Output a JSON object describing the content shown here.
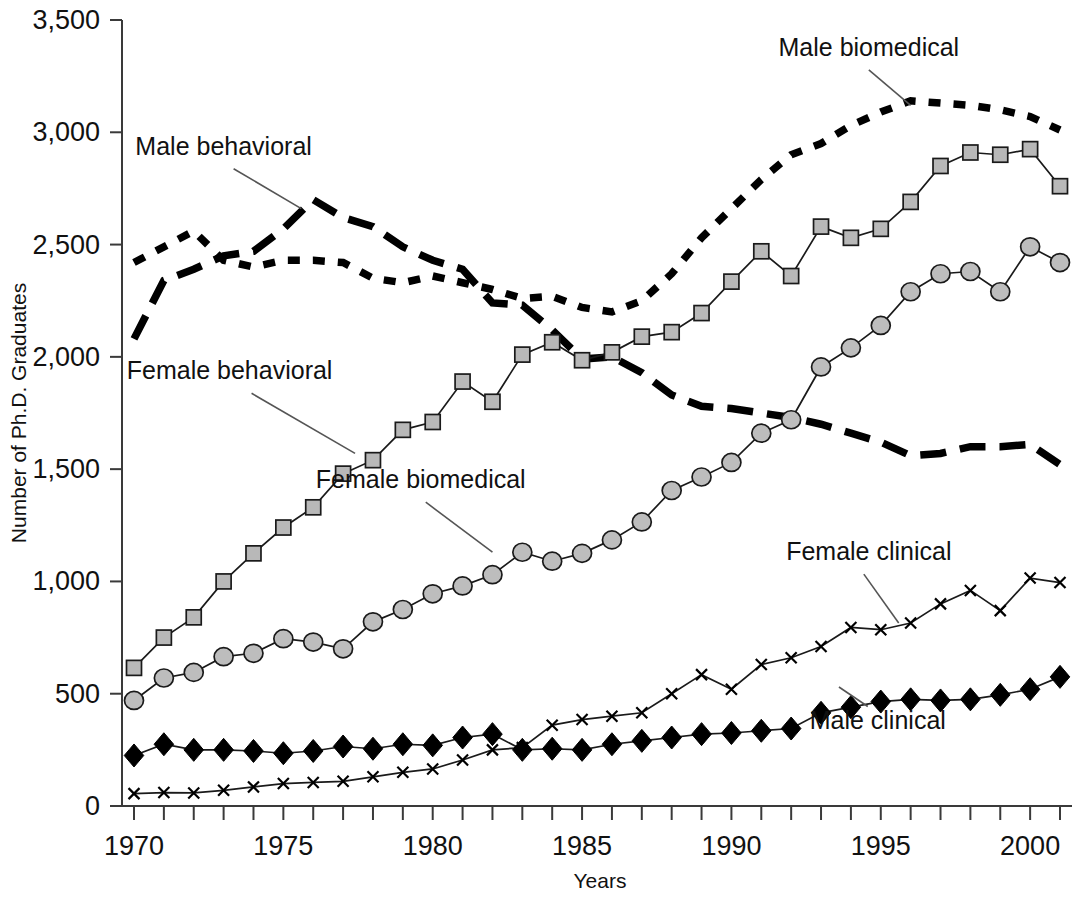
{
  "chart_data": {
    "type": "line",
    "title": "",
    "xlabel": "Years",
    "ylabel": "Number of Ph.D. Graduates",
    "xlim": [
      1969.4,
      2001.6
    ],
    "ylim": [
      0,
      3500
    ],
    "grid": false,
    "legend_position": "inline-annotations",
    "x": [
      1970,
      1971,
      1972,
      1973,
      1974,
      1975,
      1976,
      1977,
      1978,
      1979,
      1980,
      1981,
      1982,
      1983,
      1984,
      1985,
      1986,
      1987,
      1988,
      1989,
      1990,
      1991,
      1992,
      1993,
      1994,
      1995,
      1996,
      1997,
      1998,
      1999,
      2000,
      2001
    ],
    "x_tick_labels": [
      "1970",
      "1975",
      "1980",
      "1985",
      "1990",
      "1995",
      "2000"
    ],
    "x_tick_values": [
      1970,
      1975,
      1980,
      1985,
      1990,
      1995,
      2000
    ],
    "y_tick_labels": [
      "0",
      "500",
      "1,000",
      "1,500",
      "2,000",
      "2,500",
      "3,000",
      "3,500"
    ],
    "y_tick_values": [
      0,
      500,
      1000,
      1500,
      2000,
      2500,
      3000,
      3500
    ],
    "series": [
      {
        "name": "Male biomedical",
        "marker": "none",
        "line_style": "short-dash",
        "color": "#000000",
        "label_x": 1994.6,
        "label_y": 3340,
        "values": [
          2420,
          2490,
          2560,
          2430,
          2400,
          2430,
          2430,
          2420,
          2350,
          2330,
          2360,
          2330,
          2300,
          2260,
          2270,
          2220,
          2200,
          2250,
          2370,
          2530,
          2660,
          2790,
          2900,
          2950,
          3030,
          3090,
          3140,
          3130,
          3120,
          3100,
          3070,
          3010
        ]
      },
      {
        "name": "Male behavioral",
        "marker": "none",
        "line_style": "long-dash",
        "color": "#000000",
        "label_x": 1972.7,
        "label_y": 2890,
        "values": [
          2080,
          2340,
          2390,
          2450,
          2470,
          2570,
          2700,
          2620,
          2580,
          2490,
          2430,
          2390,
          2240,
          2230,
          2120,
          1990,
          2000,
          1930,
          1830,
          1780,
          1770,
          1750,
          1730,
          1700,
          1660,
          1620,
          1560,
          1570,
          1600,
          1600,
          1610,
          1520
        ]
      },
      {
        "name": "Female behavioral",
        "marker": "square",
        "line_style": "solid",
        "color": "#b8b8b8",
        "label_x": 1973.0,
        "label_y": 1880,
        "values": [
          615,
          750,
          840,
          1000,
          1125,
          1240,
          1330,
          1480,
          1540,
          1675,
          1710,
          1890,
          1800,
          2010,
          2065,
          1985,
          2020,
          2090,
          2110,
          2195,
          2335,
          2470,
          2360,
          2580,
          2530,
          2570,
          2690,
          2850,
          2910,
          2900,
          2925,
          2760
        ]
      },
      {
        "name": "Female biomedical",
        "marker": "circle",
        "line_style": "solid",
        "color": "#bdbdbd",
        "label_x": 1979.4,
        "label_y": 1400,
        "values": [
          470,
          570,
          595,
          665,
          680,
          745,
          730,
          700,
          820,
          875,
          945,
          980,
          1030,
          1130,
          1090,
          1125,
          1185,
          1265,
          1405,
          1465,
          1530,
          1660,
          1720,
          1955,
          2040,
          2140,
          2290,
          2370,
          2380,
          2290,
          2490,
          2420
        ]
      },
      {
        "name": "Female clinical",
        "marker": "x",
        "line_style": "solid",
        "color": "#000000",
        "label_x": 1994.4,
        "label_y": 1080,
        "values": [
          55,
          60,
          58,
          70,
          85,
          100,
          105,
          110,
          130,
          150,
          165,
          205,
          250,
          260,
          360,
          385,
          400,
          415,
          500,
          585,
          520,
          630,
          660,
          710,
          795,
          785,
          815,
          900,
          960,
          870,
          1015,
          995
        ]
      },
      {
        "name": "Male clinical",
        "marker": "diamond",
        "line_style": "solid",
        "color": "#000000",
        "label_x": 1994.6,
        "label_y": 335,
        "values": [
          225,
          275,
          250,
          250,
          245,
          235,
          245,
          265,
          255,
          275,
          270,
          305,
          320,
          250,
          255,
          250,
          275,
          290,
          305,
          320,
          325,
          335,
          345,
          415,
          440,
          465,
          475,
          470,
          475,
          495,
          520,
          575
        ]
      }
    ]
  },
  "axis": {
    "y_title": "Number of Ph.D. Graduates",
    "x_title": "Years"
  }
}
